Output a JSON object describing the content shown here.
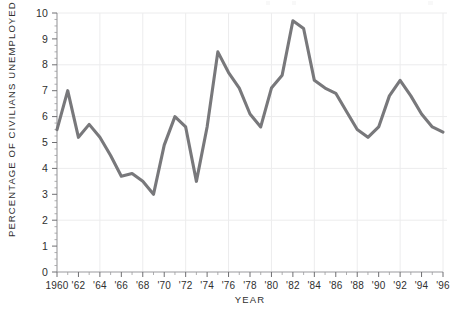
{
  "chart_data": {
    "type": "line",
    "title": "",
    "xlabel": "YEAR",
    "ylabel": "PERCENTAGE OF CIVILIANS UNEMPLOYED",
    "xlim": [
      1960,
      1996
    ],
    "ylim": [
      0,
      10
    ],
    "grid": true,
    "legend": "none",
    "y_ticks": [
      0,
      1,
      2,
      3,
      4,
      5,
      6,
      7,
      8,
      9,
      10
    ],
    "y_tick_labels": [
      "0",
      "1",
      "2",
      "3",
      "4",
      "5",
      "6",
      "7",
      "8",
      "9",
      "10"
    ],
    "y_gridlines": [
      2,
      4,
      6,
      8,
      10
    ],
    "x_ticks": [
      1960,
      1962,
      1964,
      1966,
      1968,
      1970,
      1972,
      1974,
      1976,
      1978,
      1980,
      1982,
      1984,
      1986,
      1988,
      1990,
      1992,
      1994,
      1996
    ],
    "x_tick_labels": [
      "1960",
      "'62",
      "'64",
      "'66",
      "'68",
      "'70",
      "'72",
      "'74",
      "'76",
      "'78",
      "'80",
      "'82",
      "'84",
      "'86",
      "'88",
      "'90",
      "'92",
      "'94",
      "'96"
    ],
    "x_minor_tick_step": 1,
    "x_gridlines": [
      1964,
      1968,
      1972,
      1976,
      1980,
      1984,
      1988,
      1992,
      1996
    ],
    "series": [
      {
        "name": "Percentage of civilians unemployed",
        "color": "#78787b",
        "x": [
          1960,
          1961,
          1962,
          1963,
          1964,
          1965,
          1966,
          1967,
          1968,
          1969,
          1970,
          1971,
          1972,
          1973,
          1974,
          1975,
          1976,
          1977,
          1978,
          1979,
          1980,
          1981,
          1982,
          1983,
          1984,
          1985,
          1986,
          1987,
          1988,
          1989,
          1990,
          1991,
          1992,
          1993,
          1994,
          1995,
          1996
        ],
        "values": [
          5.5,
          7.0,
          5.2,
          5.7,
          5.2,
          4.5,
          3.7,
          3.8,
          3.5,
          3.0,
          4.9,
          6.0,
          5.6,
          3.5,
          5.6,
          8.5,
          7.7,
          7.1,
          6.1,
          5.6,
          7.1,
          7.6,
          9.7,
          9.4,
          7.4,
          7.1,
          6.9,
          6.2,
          5.5,
          5.2,
          5.6,
          6.8,
          7.4,
          6.8,
          6.1,
          5.6,
          5.4
        ]
      }
    ]
  },
  "axes": {
    "y_axis_title": "PERCENTAGE OF CIVILIANS UNEMPLOYED",
    "x_axis_title": "YEAR"
  },
  "colors": {
    "line": "#78787b",
    "grid": "#ececed",
    "axis": "#9a9a9d",
    "text": "#2f2f2f",
    "background": "#ffffff"
  }
}
